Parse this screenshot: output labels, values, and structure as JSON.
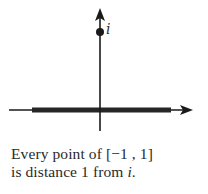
{
  "figure": {
    "colors": {
      "axis": "#1a1a1a",
      "segment": "#262626",
      "point": "#1a1a1a",
      "label": "#333333",
      "background": "#ffffff"
    },
    "point_label": "i",
    "highlighted_interval": "[-1, 1]"
  },
  "caption": {
    "line1_prefix": "Every point of [",
    "line1_minus_one": "−1",
    "line1_sep": " , ",
    "line1_one": "1",
    "line1_suffix": "]",
    "line2_prefix": "is distance 1 from ",
    "line2_var": "i",
    "line2_suffix": "."
  }
}
